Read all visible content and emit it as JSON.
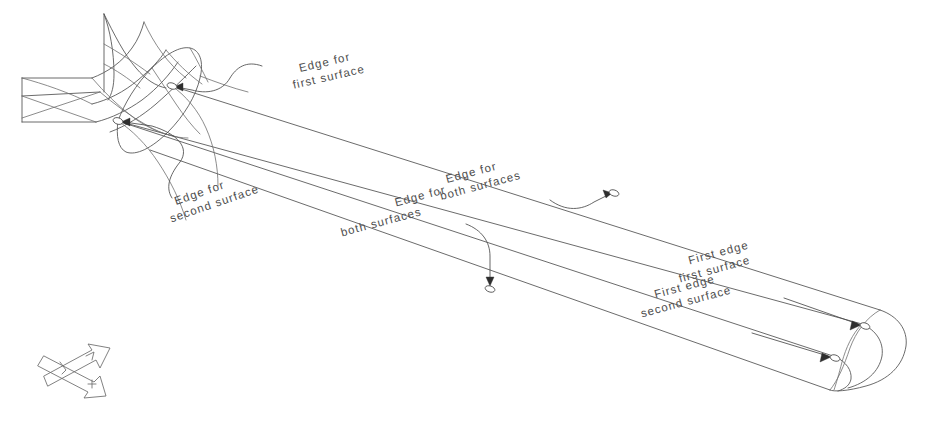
{
  "figure": {
    "background_color": "#ffffff",
    "line_color": "#5a5a5a",
    "text_color": "#4d4d4d",
    "width": 927,
    "height": 427
  },
  "annotations": [
    {
      "id": "edge-first-surface",
      "line1": "Edge for",
      "line2": "first surface",
      "text_x": 300,
      "text_y": 72,
      "rotation": -13,
      "leader": "M 262,66 C 246,60 236,68 230,78 C 222,92 206,94 192,90 L 176,87",
      "arrow_x": 174,
      "arrow_y": 87,
      "arrow_angle": 188,
      "node_x": 172,
      "node_y": 86
    },
    {
      "id": "edge-second-surface",
      "line1": "Edge for",
      "line2": "second surface",
      "text_x": 176,
      "text_y": 205,
      "rotation": -19,
      "leader": "M 172,198 C 164,186 172,172 180,162 C 190,148 178,134 152,126 L 124,122",
      "arrow_x": 121,
      "arrow_y": 122,
      "arrow_angle": 186,
      "node_x": 118,
      "node_y": 121
    },
    {
      "id": "edge-both-surfaces-upper",
      "line1": "Edge for",
      "line2": "both surfaces",
      "text_x": 447,
      "text_y": 183,
      "rotation": -15,
      "leader": "M 550,200 C 566,212 582,210 594,202 L 610,194",
      "arrow_x": 612,
      "arrow_y": 193,
      "arrow_angle": -28,
      "node_x": 614,
      "node_y": 193
    },
    {
      "id": "edge-both-surfaces-lower",
      "line1": "Edge for",
      "line2": "both surfaces",
      "text_x": 338,
      "text_y": 222,
      "rotation": -15,
      "leader": "M 466,224 C 482,230 490,242 490,256 L 490,282",
      "arrow_x": 490,
      "arrow_y": 285,
      "arrow_angle": 90,
      "node_x": 490,
      "node_y": 288
    },
    {
      "id": "first-edge-first-surface",
      "line1": "First edge",
      "line2": "first surface",
      "text_x": 676,
      "text_y": 268,
      "rotation": -15,
      "leader": "M 784,298 L 858,324",
      "arrow_x": 861,
      "arrow_y": 325,
      "arrow_angle": 20,
      "node_x": 864,
      "node_y": 326
    },
    {
      "id": "first-edge-second-surface",
      "line1": "First edge",
      "line2": "second surface",
      "text_x": 638,
      "text_y": 303,
      "rotation": -15,
      "leader": "M 752,333 L 828,356",
      "arrow_x": 831,
      "arrow_y": 357,
      "arrow_angle": 17,
      "node_x": 834,
      "node_y": 358
    }
  ],
  "axis_indicator": {
    "name": "orientation-axes-icon",
    "x": 30,
    "y": 340
  }
}
